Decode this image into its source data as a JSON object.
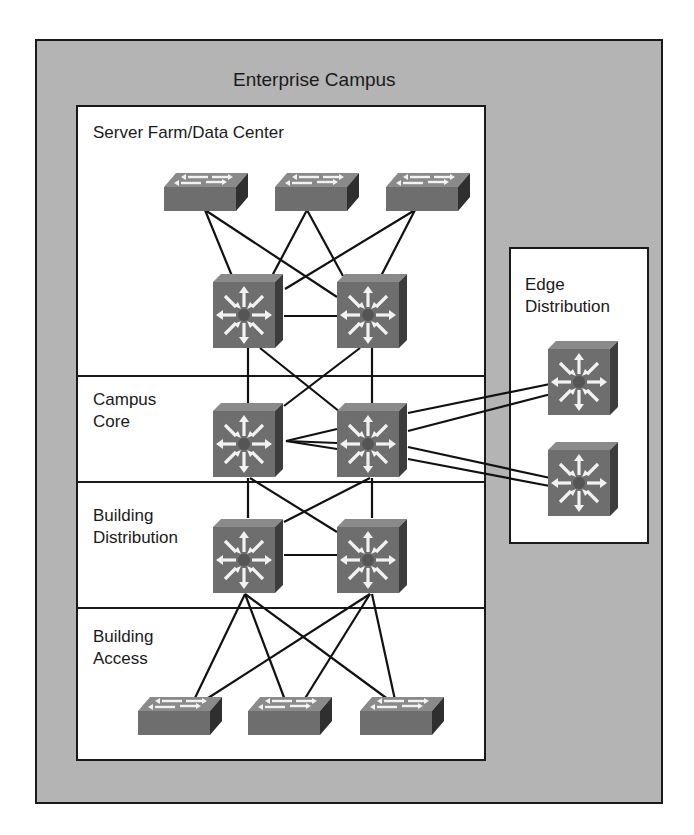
{
  "diagram": {
    "title": "Enterprise Campus",
    "colors": {
      "outer_fill": "#b4b4b4",
      "inner_fill": "#ffffff",
      "border": "#1a1a1a",
      "device_front": "#6e6e6e",
      "device_top": "#8a8a8a",
      "device_side": "#3c3c3c",
      "arrow": "#f2f2f2",
      "link": "#111111"
    },
    "modules": [
      {
        "id": "server-farm",
        "label": "Server Farm/Data Center"
      },
      {
        "id": "campus-core",
        "label": "Campus\nCore"
      },
      {
        "id": "building-distribution",
        "label": "Building\nDistribution"
      },
      {
        "id": "building-access",
        "label": "Building\nAccess"
      },
      {
        "id": "edge-distribution",
        "label": "Edge\nDistribution"
      }
    ],
    "devices": [
      {
        "id": "sf-sw1",
        "type": "layer2-switch",
        "module": "server-farm"
      },
      {
        "id": "sf-sw2",
        "type": "layer2-switch",
        "module": "server-farm"
      },
      {
        "id": "sf-sw3",
        "type": "layer2-switch",
        "module": "server-farm"
      },
      {
        "id": "sf-ml1",
        "type": "multilayer-switch",
        "module": "server-farm"
      },
      {
        "id": "sf-ml2",
        "type": "multilayer-switch",
        "module": "server-farm"
      },
      {
        "id": "core-ml1",
        "type": "multilayer-switch",
        "module": "campus-core"
      },
      {
        "id": "core-ml2",
        "type": "multilayer-switch",
        "module": "campus-core"
      },
      {
        "id": "bd-ml1",
        "type": "multilayer-switch",
        "module": "building-distribution"
      },
      {
        "id": "bd-ml2",
        "type": "multilayer-switch",
        "module": "building-distribution"
      },
      {
        "id": "ba-sw1",
        "type": "layer2-switch",
        "module": "building-access"
      },
      {
        "id": "ba-sw2",
        "type": "layer2-switch",
        "module": "building-access"
      },
      {
        "id": "ba-sw3",
        "type": "layer2-switch",
        "module": "building-access"
      },
      {
        "id": "ed-ml1",
        "type": "multilayer-switch",
        "module": "edge-distribution"
      },
      {
        "id": "ed-ml2",
        "type": "multilayer-switch",
        "module": "edge-distribution"
      }
    ],
    "links": [
      [
        "sf-sw1",
        "sf-ml1"
      ],
      [
        "sf-sw1",
        "sf-ml2"
      ],
      [
        "sf-sw2",
        "sf-ml1"
      ],
      [
        "sf-sw2",
        "sf-ml2"
      ],
      [
        "sf-sw3",
        "sf-ml1"
      ],
      [
        "sf-sw3",
        "sf-ml2"
      ],
      [
        "sf-ml1",
        "sf-ml2"
      ],
      [
        "sf-ml1",
        "core-ml1"
      ],
      [
        "sf-ml1",
        "core-ml2"
      ],
      [
        "sf-ml2",
        "core-ml1"
      ],
      [
        "sf-ml2",
        "core-ml2"
      ],
      [
        "core-ml1",
        "core-ml2"
      ],
      [
        "core-ml1",
        "core-ml2"
      ],
      [
        "core-ml2",
        "ed-ml1"
      ],
      [
        "core-ml2",
        "ed-ml1"
      ],
      [
        "core-ml2",
        "ed-ml2"
      ],
      [
        "core-ml2",
        "ed-ml2"
      ],
      [
        "core-ml1",
        "bd-ml1"
      ],
      [
        "core-ml1",
        "bd-ml2"
      ],
      [
        "core-ml2",
        "bd-ml1"
      ],
      [
        "core-ml2",
        "bd-ml2"
      ],
      [
        "bd-ml1",
        "bd-ml2"
      ],
      [
        "bd-ml1",
        "ba-sw1"
      ],
      [
        "bd-ml1",
        "ba-sw2"
      ],
      [
        "bd-ml1",
        "ba-sw3"
      ],
      [
        "bd-ml2",
        "ba-sw1"
      ],
      [
        "bd-ml2",
        "ba-sw2"
      ],
      [
        "bd-ml2",
        "ba-sw3"
      ]
    ]
  }
}
